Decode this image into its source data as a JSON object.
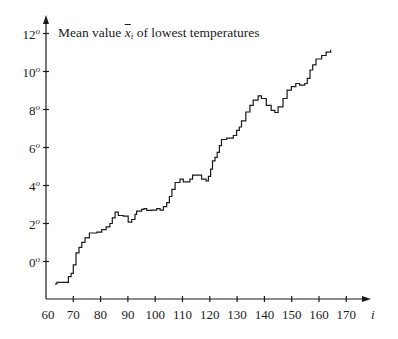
{
  "chart": {
    "title_prefix": "Mean value",
    "title_var": "x",
    "title_sub": "i",
    "title_suffix": "of lowest temperatures",
    "x_axis_label": "i",
    "degree_mark": "o",
    "line_color": "#1a1a1a",
    "y_ticks": [
      {
        "value": 12,
        "label": "12"
      },
      {
        "value": 10,
        "label": "10"
      },
      {
        "value": 8,
        "label": "8"
      },
      {
        "value": 6,
        "label": "6"
      },
      {
        "value": 4,
        "label": "4"
      },
      {
        "value": 2,
        "label": "2"
      },
      {
        "value": 0,
        "label": "0"
      }
    ],
    "x_ticks": [
      {
        "value": 60,
        "label": "60"
      },
      {
        "value": 70,
        "label": "70"
      },
      {
        "value": 80,
        "label": "80"
      },
      {
        "value": 90,
        "label": "90"
      },
      {
        "value": 100,
        "label": "100"
      },
      {
        "value": 110,
        "label": "110"
      },
      {
        "value": 120,
        "label": "120"
      },
      {
        "value": 130,
        "label": "130"
      },
      {
        "value": 140,
        "label": "140"
      },
      {
        "value": 150,
        "label": "150"
      },
      {
        "value": 160,
        "label": "160"
      },
      {
        "value": 170,
        "label": "170"
      }
    ]
  },
  "chart_data": {
    "type": "line",
    "xlabel": "i",
    "ylabel": "",
    "xlim": [
      60,
      175
    ],
    "ylim": [
      -2,
      12.5
    ],
    "grid": false,
    "legend": null,
    "step": true,
    "series": [
      {
        "name": "Mean value of lowest temperatures",
        "x": [
          63.3,
          64.0,
          67.6,
          68.2,
          69.2,
          70.0,
          71.0,
          72.1,
          73.1,
          74.3,
          75.9,
          78.6,
          80.4,
          82.0,
          83.4,
          84.3,
          85.3,
          86.5,
          88.3,
          90.1,
          91.4,
          92.6,
          93.2,
          95.0,
          95.9,
          96.9,
          98.7,
          100.6,
          101.8,
          103.0,
          104.2,
          105.2,
          106.1,
          107.3,
          109.1,
          110.3,
          112.7,
          113.7,
          116.4,
          117.0,
          118.6,
          119.5,
          120.3,
          121.0,
          121.9,
          122.7,
          123.5,
          124.3,
          126.2,
          128.6,
          129.8,
          130.8,
          131.6,
          133.2,
          134.7,
          135.9,
          137.7,
          138.9,
          140.7,
          142.5,
          143.8,
          145.0,
          146.8,
          148.3,
          149.9,
          151.5,
          152.9,
          154.8,
          155.7,
          156.7,
          157.7,
          158.9,
          161.0,
          162.6,
          164.3
        ],
        "y": [
          -1.18,
          -1.1,
          -1.1,
          -0.8,
          -0.62,
          -0.18,
          0.45,
          0.74,
          1.01,
          1.24,
          1.5,
          1.54,
          1.68,
          1.82,
          2.0,
          2.3,
          2.6,
          2.42,
          2.39,
          2.07,
          2.21,
          2.48,
          2.65,
          2.74,
          2.78,
          2.69,
          2.7,
          2.78,
          2.7,
          2.89,
          3.1,
          3.42,
          3.8,
          4.16,
          4.33,
          4.19,
          4.33,
          4.55,
          4.55,
          4.33,
          4.24,
          4.48,
          4.86,
          5.3,
          5.48,
          5.75,
          6.1,
          6.42,
          6.49,
          6.63,
          6.9,
          7.08,
          7.4,
          7.87,
          8.22,
          8.49,
          8.72,
          8.58,
          8.22,
          7.96,
          7.84,
          8.14,
          8.58,
          9.02,
          9.2,
          9.37,
          9.28,
          9.37,
          9.64,
          10.08,
          10.35,
          10.66,
          10.84,
          11.02,
          11.14
        ]
      }
    ]
  }
}
